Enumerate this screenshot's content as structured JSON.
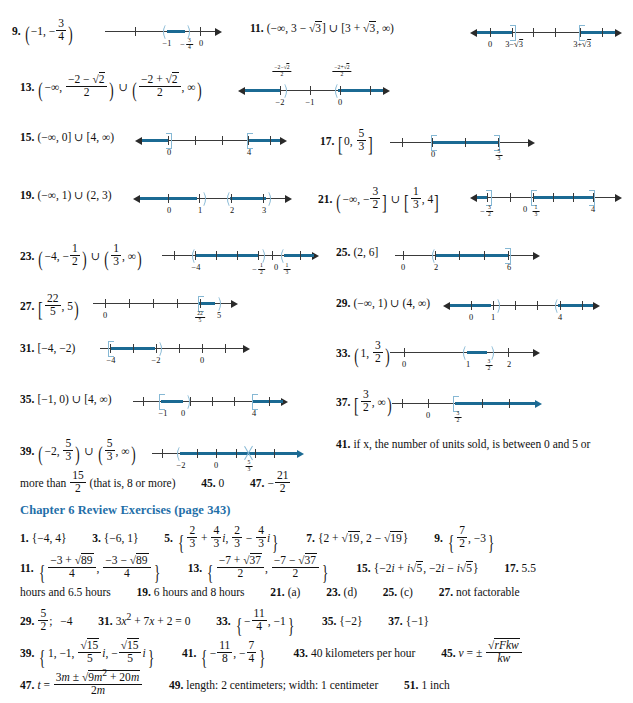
{
  "page": {
    "kind": "textbook-answer-key",
    "width": 633,
    "height": 703,
    "accent_color": "#1b6fa8",
    "line_color": "#1b6a93",
    "bracket_color": "#86b8d4"
  },
  "exercises": [
    {
      "number": "9.",
      "answer_text": "(−1, −3/4)",
      "numberline": {
        "ticks": [
          "",
          "−1",
          "−3/4",
          "0",
          ""
        ],
        "tick_labels_visible": [
          "−1",
          "−¾",
          "0"
        ],
        "interval_type": "open-open",
        "shaded_from": "−1",
        "shaded_to": "−3/4",
        "arrow_right": true,
        "arrow_left": false
      }
    },
    {
      "number": "11.",
      "answer_text": "(−∞, 3 − √3] ∪ [3 + √3, ∞)",
      "numberline": {
        "tick_labels_visible": [
          "0",
          "3−√3",
          "3+√3"
        ],
        "interval_type": "closed-union-closed",
        "arrow_right": true,
        "arrow_left": true
      }
    },
    {
      "number": "13.",
      "answer_text": "(−∞, (−2 − √2)/2) ∪ ((−2 + √2)/2, ∞)",
      "numberline": {
        "tick_labels_above": [
          "(−2−√2)/2",
          "(−2+√2)/2"
        ],
        "tick_labels_below": [
          "−2",
          "−1",
          "0"
        ],
        "interval_type": "open-union-open",
        "arrow_right": true,
        "arrow_left": true
      }
    },
    {
      "number": "15.",
      "answer_text": "(−∞, 0] ∪ [4, ∞)",
      "numberline": {
        "tick_labels_visible": [
          "0",
          "4"
        ],
        "interval_type": "closed-union-closed",
        "arrow_right": true,
        "arrow_left": true
      }
    },
    {
      "number": "17.",
      "answer_text": "[0, 5/3]",
      "numberline": {
        "tick_labels_visible": [
          "0",
          "5/3"
        ],
        "interval_type": "closed-closed",
        "arrow_right": true,
        "arrow_left": false
      }
    },
    {
      "number": "19.",
      "answer_text": "(−∞, 1) ∪ (2, 3)",
      "numberline": {
        "tick_labels_visible": [
          "0",
          "1",
          "2",
          "3"
        ],
        "interval_type": "open-union-open",
        "arrow_right": true,
        "arrow_left": true
      }
    },
    {
      "number": "21.",
      "answer_text": "(−∞, −3/2] ∪ [1/3, 4]",
      "numberline": {
        "tick_labels_visible": [
          "−3/2",
          "0",
          "1/3",
          "4"
        ],
        "interval_type": "closed-union-closed",
        "arrow_right": true,
        "arrow_left": true
      }
    },
    {
      "number": "23.",
      "answer_text": "(−4, −1/2) ∪ (1/3, ∞)",
      "numberline": {
        "tick_labels_visible": [
          "−4",
          "−1/2",
          "0",
          "1/3"
        ],
        "interval_type": "open-union-open",
        "arrow_right": true,
        "arrow_left": false
      }
    },
    {
      "number": "25.",
      "answer_text": "(2, 6]",
      "numberline": {
        "tick_labels_visible": [
          "0",
          "2",
          "6"
        ],
        "interval_type": "open-closed",
        "arrow_right": true,
        "arrow_left": false
      }
    },
    {
      "number": "27.",
      "answer_text": "[22/5, 5)",
      "numberline": {
        "tick_labels_visible": [
          "0",
          "22/5",
          "5"
        ],
        "interval_type": "closed-open",
        "arrow_right": true,
        "arrow_left": false
      }
    },
    {
      "number": "29.",
      "answer_text": "(−∞, 1) ∪ (4, ∞)",
      "numberline": {
        "tick_labels_visible": [
          "0",
          "1",
          "4"
        ],
        "interval_type": "open-union-open",
        "arrow_right": true,
        "arrow_left": true
      }
    },
    {
      "number": "31.",
      "answer_text": "[−4, −2)",
      "numberline": {
        "tick_labels_visible": [
          "−4",
          "−2",
          "0"
        ],
        "interval_type": "closed-open",
        "arrow_right": true,
        "arrow_left": false
      }
    },
    {
      "number": "33.",
      "answer_text": "(1, 3/2)",
      "numberline": {
        "tick_labels_visible": [
          "0",
          "1",
          "3/2",
          "2"
        ],
        "interval_type": "open-open",
        "arrow_right": true,
        "arrow_left": false
      }
    },
    {
      "number": "35.",
      "answer_text": "[−1, 0) ∪ [4, ∞)",
      "numberline": {
        "tick_labels_visible": [
          "−1",
          "0",
          "4"
        ],
        "interval_type": "closed-open-union-closed",
        "arrow_right": true,
        "arrow_left": false
      }
    },
    {
      "number": "37.",
      "answer_text": "[3/2, ∞)",
      "numberline": {
        "tick_labels_visible": [
          "0",
          "3/2"
        ],
        "interval_type": "closed-infinite",
        "arrow_right": true,
        "arrow_left": false
      }
    },
    {
      "number": "39.",
      "answer_text": "(−2, 5/3) ∪ (5/3, ∞)",
      "numberline": {
        "tick_labels_visible": [
          "−2",
          "0",
          "5/3"
        ],
        "interval_type": "open-union-open-punctured",
        "arrow_right": true,
        "arrow_left": false
      }
    },
    {
      "number": "41.",
      "answer_text": "if x, the number of units sold, is between 0 and 5 or more than 15/2 (that is, 8 or more)"
    },
    {
      "number": "45.",
      "answer_text": "0"
    },
    {
      "number": "47.",
      "answer_text": "−21/2"
    }
  ],
  "review": {
    "heading": "Chapter 6 Review Exercises (page 343)",
    "answers": [
      {
        "number": "1.",
        "text": "{−4, 4}"
      },
      {
        "number": "3.",
        "text": "{−6, 1}"
      },
      {
        "number": "5.",
        "text": "{2/3 + 4/3 i, 2/3 − 4/3 i}"
      },
      {
        "number": "7.",
        "text": "{2 + √19, 2 − √19}"
      },
      {
        "number": "9.",
        "text": "{7/2, −3}"
      },
      {
        "number": "11.",
        "text": "{(−3 + √89)/4, (−3 − √89)/4}"
      },
      {
        "number": "13.",
        "text": "{(−7 + √37)/2, (−7 − √37)/2}"
      },
      {
        "number": "15.",
        "text": "{−2i + i√5, −2i − i√5}"
      },
      {
        "number": "17.",
        "text": "5.5 hours and 6.5 hours"
      },
      {
        "number": "19.",
        "text": "6 hours and 8 hours"
      },
      {
        "number": "21.",
        "text": "(a)"
      },
      {
        "number": "23.",
        "text": "(d)"
      },
      {
        "number": "25.",
        "text": "(c)"
      },
      {
        "number": "27.",
        "text": "not factorable"
      },
      {
        "number": "29.",
        "text": "5/2;  −4"
      },
      {
        "number": "31.",
        "text": "3x² + 7x + 2 = 0"
      },
      {
        "number": "33.",
        "text": "{−11/4, −1}"
      },
      {
        "number": "35.",
        "text": "{−2}"
      },
      {
        "number": "37.",
        "text": "{−1}"
      },
      {
        "number": "39.",
        "text": "{1, −1, (√15/5)i, −(√15/5)i}"
      },
      {
        "number": "41.",
        "text": "{−11/8, −7/4}"
      },
      {
        "number": "43.",
        "text": "40 kilometers per hour"
      },
      {
        "number": "45.",
        "text": "v = ± √(rFkw)/kw"
      },
      {
        "number": "47.",
        "text": "t = (3m ± √(9m² + 20m))/2m"
      },
      {
        "number": "49.",
        "text": "length: 2 centimeters;  width: 1 centimeter"
      },
      {
        "number": "51.",
        "text": "1 inch"
      }
    ],
    "fragments": {
      "n41_line1": "if x, the number of units sold, is between 0 and 5 or",
      "n41_line2_pre": "more than",
      "n41_line2_post": "(that is, 8 or more)",
      "n17_tail": "hours and 6.5 hours",
      "n19_text": "6 hours and 8 hours",
      "n21_text": "(a)",
      "n23_text": "(d)",
      "n25_text": "(c)",
      "n27_text": "not factorable",
      "n17_head": "5.5",
      "n43_text": "40 kilometers per hour",
      "n49_text": "length: 2 centimeters;   width: 1 centimeter",
      "n51_text": "1 inch",
      "n31_text": "3x² + 7x + 2 = 0",
      "n35_text": "{−2}",
      "n37_text": "{−1}",
      "n45_num": "45.",
      "n47_num": "47."
    }
  }
}
